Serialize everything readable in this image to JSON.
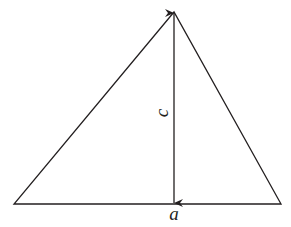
{
  "diagram": {
    "type": "triangle-with-height",
    "labels": {
      "base": "a",
      "height": "c"
    },
    "colors": {
      "stroke": "#231f20",
      "background": "#ffffff"
    }
  }
}
